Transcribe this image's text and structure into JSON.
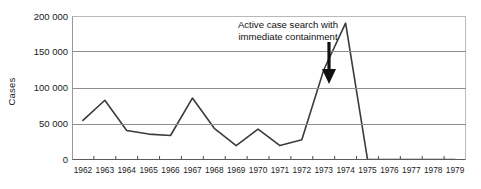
{
  "chart_data": {
    "type": "line",
    "title": "",
    "xlabel": "",
    "ylabel": "Cases",
    "ylim": [
      0,
      200000
    ],
    "yticks": [
      0,
      50000,
      100000,
      150000,
      200000
    ],
    "ytick_labels": [
      "0",
      "50 000",
      "100 000",
      "150 000",
      "200 000"
    ],
    "grid": true,
    "legend": "none",
    "categories": [
      "1962",
      "1963",
      "1964",
      "1965",
      "1966",
      "1967",
      "1968",
      "1969",
      "1970",
      "1971",
      "1972",
      "1973",
      "1974",
      "1975",
      "1976",
      "1977",
      "1978",
      "1979"
    ],
    "series": [
      {
        "name": "Cases",
        "color": "#3b3b3b",
        "values": [
          55000,
          83000,
          41000,
          36000,
          34000,
          86000,
          44000,
          20000,
          43000,
          20000,
          28000,
          125000,
          190000,
          1000,
          500,
          500,
          500,
          500
        ]
      }
    ],
    "annotations": [
      {
        "text_line_1": "Active case search with",
        "text_line_2": "immediate containment",
        "arrow": "down-arrow",
        "points_to_category": "1973"
      }
    ]
  },
  "axis": {
    "y_title": "Cases",
    "y_tick_labels": [
      "200 000",
      "150 000",
      "100 000",
      "50 000",
      "0"
    ],
    "x_tick_labels": [
      "1962",
      "1963",
      "1964",
      "1965",
      "1966",
      "1967",
      "1968",
      "1969",
      "1970",
      "1971",
      "1972",
      "1973",
      "1974",
      "1975",
      "1976",
      "1977",
      "1978",
      "1979"
    ]
  },
  "annotation": {
    "line1": "Active case search with",
    "line2": "immediate containment"
  },
  "colors": {
    "line": "#3b3b3b",
    "grid": "#8f8f8f",
    "frame": "#9a9a9a",
    "text": "#1a1a1a",
    "background": "#ffffff"
  }
}
